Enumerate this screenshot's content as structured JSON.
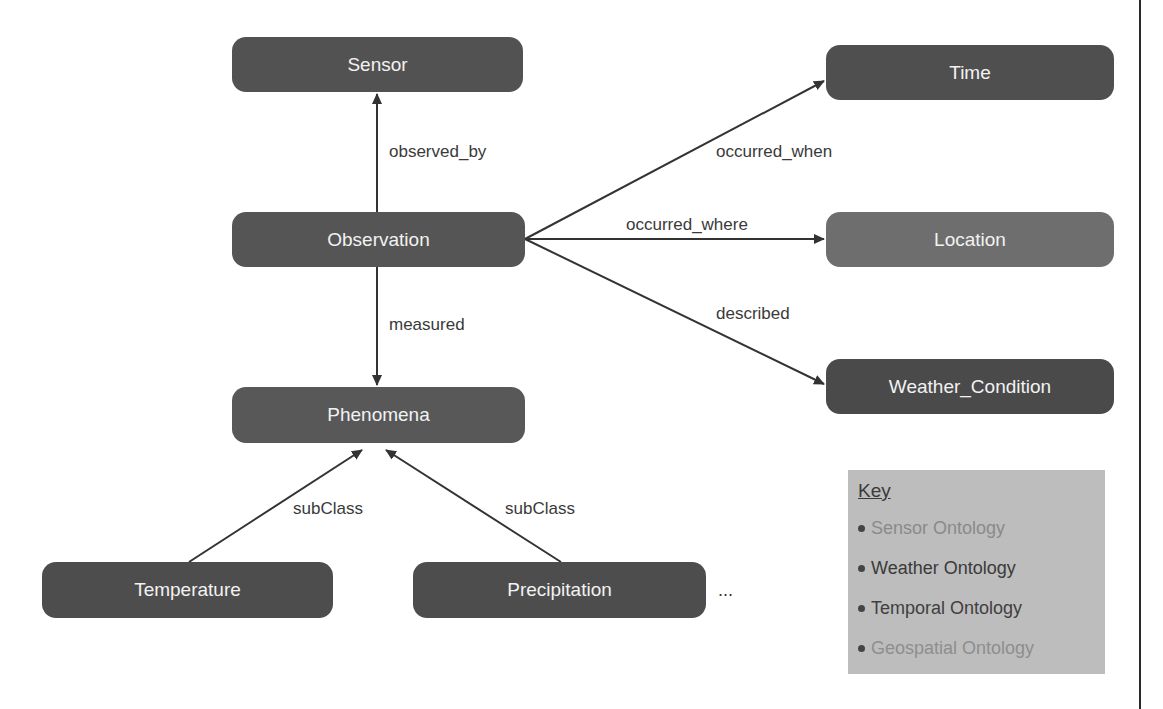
{
  "nodes": {
    "sensor": {
      "label": "Sensor",
      "color": "#525252"
    },
    "observation": {
      "label": "Observation",
      "color": "#555555"
    },
    "phenomena": {
      "label": "Phenomena",
      "color": "#585858"
    },
    "temperature": {
      "label": "Temperature",
      "color": "#4d4d4d"
    },
    "precipitation": {
      "label": "Precipitation",
      "color": "#4d4d4d"
    },
    "time": {
      "label": "Time",
      "color": "#4f4f4f"
    },
    "location": {
      "label": "Location",
      "color": "#6e6e6e"
    },
    "weather_condition": {
      "label": "Weather_Condition",
      "color": "#4a4a4a"
    }
  },
  "edges": {
    "observed_by": "observed_by",
    "measured": "measured",
    "occurred_when": "occurred_when",
    "occurred_where": "occurred_where",
    "described": "described",
    "subclass_temperature": "subClass",
    "subclass_precipitation": "subClass"
  },
  "more_indicator": "...",
  "key": {
    "title": "Key",
    "items": [
      {
        "label": "Sensor Ontology",
        "color": "#8a8a8a"
      },
      {
        "label": "Weather Ontology",
        "color": "#3a3a3a"
      },
      {
        "label": "Temporal Ontology",
        "color": "#3f3f3f"
      },
      {
        "label": "Geospatial Ontology",
        "color": "#8e8e8e"
      }
    ]
  }
}
